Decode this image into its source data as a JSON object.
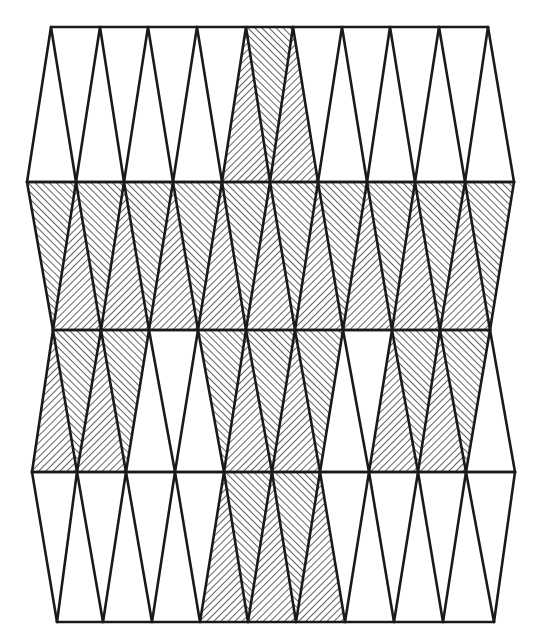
{
  "diagram": {
    "title": "",
    "stroke_color": "#1a1a1a",
    "hatch_color": "#3a3a3a",
    "background": "#ffffff",
    "rows": [
      {
        "name": "row-1",
        "top_y": 27,
        "bottom_y": 182,
        "top_nodes": [
          51,
          100,
          148,
          197,
          246,
          293,
          342,
          390,
          439,
          488
        ],
        "bottom_nodes": [
          27,
          76,
          124,
          173,
          222,
          270,
          318,
          367,
          415,
          465,
          514
        ],
        "edges_top": [
          51,
          488
        ],
        "edges_bottom": [
          27,
          514
        ],
        "up_triangles_shaded": [
          false,
          false,
          false,
          false,
          true,
          false,
          false,
          false,
          false
        ],
        "down_triangles_shaded": [
          false,
          false,
          false,
          false,
          true,
          true,
          false,
          false,
          false,
          false
        ]
      },
      {
        "name": "row-2",
        "top_y": 182,
        "bottom_y": 330,
        "top_nodes": [
          27,
          76,
          124,
          173,
          222,
          270,
          318,
          367,
          415,
          465,
          514
        ],
        "bottom_nodes": [
          53,
          101,
          149,
          198,
          246,
          295,
          343,
          392,
          440,
          490
        ],
        "edges_top": [
          27,
          514
        ],
        "edges_bottom": [
          53,
          490
        ],
        "up_triangles_shaded": [
          true,
          true,
          true,
          true,
          true,
          true,
          true,
          true,
          true
        ],
        "down_triangles_shaded": [
          true,
          true,
          true,
          true,
          true,
          true,
          true,
          true,
          true,
          true
        ]
      },
      {
        "name": "row-3",
        "top_y": 330,
        "bottom_y": 472,
        "top_nodes": [
          53,
          101,
          149,
          198,
          246,
          295,
          343,
          392,
          440,
          490
        ],
        "bottom_nodes": [
          32,
          77,
          126,
          175,
          224,
          272,
          320,
          369,
          418,
          466,
          515
        ],
        "edges_top": [
          53,
          490
        ],
        "edges_bottom": [
          32,
          515
        ],
        "up_triangles_shaded": [
          true,
          true,
          false,
          true,
          true,
          true,
          false,
          true,
          true
        ],
        "down_triangles_shaded": [
          true,
          true,
          false,
          false,
          true,
          true,
          false,
          true,
          true,
          false
        ]
      },
      {
        "name": "row-4",
        "top_y": 472,
        "bottom_y": 622,
        "top_nodes": [
          32,
          77,
          126,
          175,
          224,
          272,
          320,
          369,
          418,
          466,
          515
        ],
        "bottom_nodes": [
          57,
          103,
          152,
          200,
          248,
          296,
          345,
          394,
          443,
          494
        ],
        "edges_top": [
          32,
          515
        ],
        "edges_bottom": [
          57,
          494
        ],
        "up_triangles_shaded": [
          false,
          false,
          false,
          true,
          true,
          true,
          false,
          false,
          false
        ],
        "down_triangles_shaded": [
          false,
          false,
          false,
          false,
          true,
          true,
          false,
          false,
          false,
          false
        ]
      }
    ]
  }
}
